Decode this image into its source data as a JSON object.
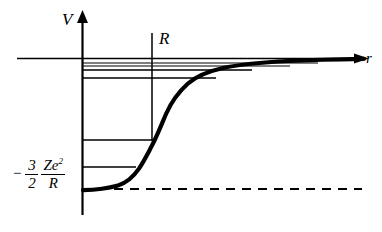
{
  "figure": {
    "background_color": "#ffffff",
    "stroke_color": "#000000"
  },
  "axes": {
    "vertical_axis_label": "V",
    "horizontal_axis_label": "r",
    "vertical_axis_name": "potential-energy-axis",
    "horizontal_axis_name": "radius-axis"
  },
  "annotations": {
    "nuclear_radius_label": "R",
    "well_depth": {
      "sign": "−",
      "coefficient_numerator": "3",
      "coefficient_denominator": "2",
      "expression_numerator": "Ze",
      "expression_numerator_exponent": "2",
      "expression_denominator": "R",
      "full_text": "− 3/2 Ze²/R"
    }
  },
  "chart_data": {
    "type": "line",
    "title": "",
    "xlabel": "r",
    "ylabel": "V",
    "grid": false,
    "legend": null,
    "xlim": [
      0,
      1.0
    ],
    "ylim": [
      -1.0,
      0.18
    ],
    "axis_origin_px": {
      "x": 82,
      "y": 58
    },
    "series": [
      {
        "name": "potential-curve",
        "style": "solid-thick",
        "color": "#000000",
        "points_px": [
          [
            83,
            190
          ],
          [
            90,
            189.6
          ],
          [
            98,
            189
          ],
          [
            106,
            188
          ],
          [
            114,
            186.4
          ],
          [
            121,
            184
          ],
          [
            127,
            180.6
          ],
          [
            133,
            175.6
          ],
          [
            139,
            168.4
          ],
          [
            145,
            158.6
          ],
          [
            151,
            146
          ],
          [
            157,
            132
          ],
          [
            163,
            118
          ],
          [
            170,
            104
          ],
          [
            178,
            92
          ],
          [
            187,
            82.5
          ],
          [
            197,
            76
          ],
          [
            209,
            71.4
          ],
          [
            223,
            68
          ],
          [
            240,
            65.4
          ],
          [
            260,
            63.4
          ],
          [
            282,
            62
          ],
          [
            305,
            61
          ],
          [
            330,
            60.2
          ],
          [
            352,
            59.6
          ],
          [
            363,
            59.2
          ]
        ]
      }
    ],
    "reference_lines": [
      {
        "name": "well-bottom-asymptote",
        "style": "dashed",
        "value_label": "− 3Ze²/(2R)",
        "y_px": 189,
        "x_start_px": 82,
        "x_end_px": 362
      },
      {
        "name": "nuclear-radius-line",
        "style": "solid",
        "label": "R",
        "x_px": 152,
        "y_start_px": 33,
        "y_end_px": 141
      }
    ],
    "energy_levels": [
      {
        "name": "energy-level-1",
        "index": 1,
        "y_px": 167,
        "x_start_px": 82,
        "x_end_px": 136
      },
      {
        "name": "energy-level-2",
        "index": 2,
        "y_px": 140,
        "x_start_px": 82,
        "x_end_px": 153
      },
      {
        "name": "energy-level-3",
        "index": 3,
        "y_px": 78,
        "x_start_px": 82,
        "x_end_px": 216
      },
      {
        "name": "energy-level-4",
        "index": 4,
        "y_px": 70,
        "x_start_px": 82,
        "x_end_px": 252
      },
      {
        "name": "energy-level-5",
        "index": 5,
        "y_px": 66,
        "x_start_px": 82,
        "x_end_px": 290
      },
      {
        "name": "energy-level-6",
        "index": 6,
        "y_px": 63,
        "x_start_px": 82,
        "x_end_px": 318
      }
    ]
  }
}
